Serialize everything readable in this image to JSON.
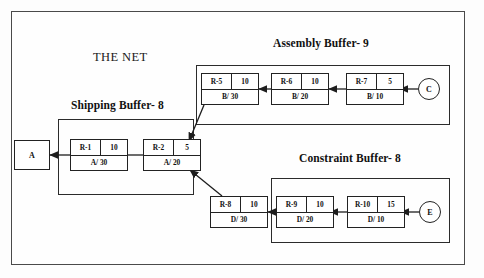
{
  "diagram": {
    "net_label": "THE NET",
    "frame": {
      "name": "outer-frame"
    },
    "buffers": [
      {
        "key": "assembly",
        "title": "Assembly Buffer- 9"
      },
      {
        "key": "shipping",
        "title": "Shipping Buffer- 8"
      },
      {
        "key": "constraint",
        "title": "Constraint Buffer- 8"
      }
    ],
    "nodes": [
      {
        "key": "r5",
        "id": "R-5",
        "qty": "10",
        "route": "B/ 30"
      },
      {
        "key": "r6",
        "id": "R-6",
        "qty": "10",
        "route": "B/ 20"
      },
      {
        "key": "r7",
        "id": "R-7",
        "qty": "5",
        "route": "B/ 10"
      },
      {
        "key": "r1",
        "id": "R-1",
        "qty": "10",
        "route": "A/ 30"
      },
      {
        "key": "r2",
        "id": "R-2",
        "qty": "5",
        "route": "A/ 20"
      },
      {
        "key": "r8",
        "id": "R-8",
        "qty": "10",
        "route": "D/ 30"
      },
      {
        "key": "r9",
        "id": "R-9",
        "qty": "10",
        "route": "D/ 20"
      },
      {
        "key": "r10",
        "id": "R-10",
        "qty": "15",
        "route": "D/ 10"
      }
    ],
    "terminals": [
      {
        "key": "a",
        "label": "A",
        "shape": "rect"
      },
      {
        "key": "c",
        "label": "C",
        "shape": "circle"
      },
      {
        "key": "e",
        "label": "E",
        "shape": "circle"
      }
    ],
    "colors": {
      "line": "#222222",
      "frame": "#4a4a4a",
      "background": "#fefefe",
      "text": "#111111"
    }
  }
}
